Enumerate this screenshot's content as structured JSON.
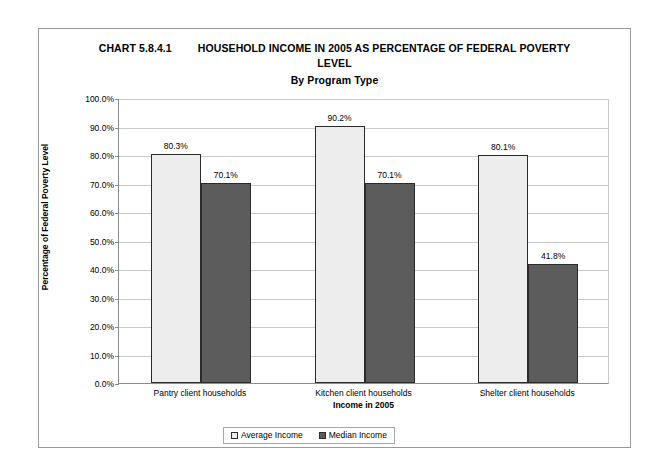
{
  "frame": {
    "border_color": "#9a9a9a"
  },
  "title": {
    "chart_number": "CHART 5.8.4.1",
    "line1": "HOUSEHOLD INCOME IN 2005 AS PERCENTAGE OF FEDERAL POVERTY",
    "line2": "LEVEL",
    "subtitle": "By Program Type"
  },
  "legend": {
    "items": [
      {
        "label": "Average Income",
        "color": "#ededed"
      },
      {
        "label": "Median Income",
        "color": "#5c5c5c"
      }
    ]
  },
  "chart_data": {
    "type": "bar",
    "subtitle": "By Program Type",
    "xlabel": "Income in 2005",
    "ylabel": "Percentage of Federal Poverty Level",
    "categories": [
      "Pantry client households",
      "Kitchen client households",
      "Shelter client households"
    ],
    "series": [
      {
        "name": "Average Income",
        "color": "#ededed",
        "values": [
          80.3,
          90.2,
          80.1
        ],
        "labels": [
          "80.3%",
          "90.2%",
          "80.1%"
        ]
      },
      {
        "name": "Median Income",
        "color": "#5c5c5c",
        "values": [
          70.1,
          70.1,
          41.8
        ],
        "labels": [
          "70.1%",
          "70.1%",
          "41.8%"
        ]
      }
    ],
    "ylim": [
      0,
      100
    ],
    "ytick_values": [
      0,
      10,
      20,
      30,
      40,
      50,
      60,
      70,
      80,
      90,
      100
    ],
    "ytick_labels": [
      "0.0%",
      "10.0%",
      "20.0%",
      "30.0%",
      "40.0%",
      "50.0%",
      "60.0%",
      "70.0%",
      "80.0%",
      "90.0%",
      "100.0%"
    ],
    "grid": true,
    "legend_position": "bottom"
  }
}
